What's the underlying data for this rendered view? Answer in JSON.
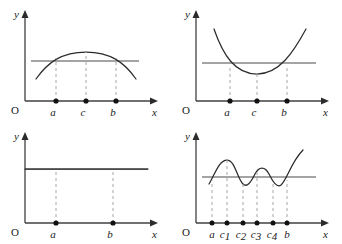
{
  "figure": {
    "background_color": "#ffffff",
    "axis_color": "#404040",
    "curve_color": "#2b2b2b",
    "dash_color": "#a8a8a8",
    "dot_color": "#111111",
    "width": 342,
    "height": 244
  },
  "panels": [
    {
      "id": "panel-top-left",
      "y_axis_label": "y",
      "x_axis_label": "x",
      "origin_label": "O",
      "curve_type": "downward-parabola",
      "curve_description": "concave-down parabola with maximum at c, intersecting the horizontal reference line at a and b",
      "reference_line": "horizontal",
      "ticks": [
        {
          "label": "a",
          "sub": "",
          "role": "left-intersection"
        },
        {
          "label": "c",
          "sub": "",
          "role": "maximum"
        },
        {
          "label": "b",
          "sub": "",
          "role": "right-intersection"
        }
      ]
    },
    {
      "id": "panel-top-right",
      "y_axis_label": "y",
      "x_axis_label": "x",
      "origin_label": "O",
      "curve_type": "upward-parabola",
      "curve_description": "concave-up parabola with minimum at c, intersecting the horizontal reference line at a and b",
      "reference_line": "horizontal",
      "ticks": [
        {
          "label": "a",
          "sub": "",
          "role": "left-intersection"
        },
        {
          "label": "c",
          "sub": "",
          "role": "minimum"
        },
        {
          "label": "b",
          "sub": "",
          "role": "right-intersection"
        }
      ]
    },
    {
      "id": "panel-bottom-left",
      "y_axis_label": "y",
      "x_axis_label": "x",
      "origin_label": "O",
      "curve_type": "constant",
      "curve_description": "constant function coinciding with the horizontal reference line across the whole interval",
      "reference_line": "horizontal",
      "ticks": [
        {
          "label": "a",
          "sub": "",
          "role": "interval-left"
        },
        {
          "label": "b",
          "sub": "",
          "role": "interval-right"
        }
      ]
    },
    {
      "id": "panel-bottom-right",
      "y_axis_label": "y",
      "x_axis_label": "x",
      "origin_label": "O",
      "curve_type": "oscillating",
      "curve_description": "wavy curve crossing the horizontal reference line at a and b with two maxima and two minima",
      "reference_line": "horizontal",
      "ticks": [
        {
          "label": "a",
          "sub": "",
          "role": "left-intersection"
        },
        {
          "label": "c",
          "sub": "1",
          "role": "maximum"
        },
        {
          "label": "c",
          "sub": "2",
          "role": "minimum"
        },
        {
          "label": "c",
          "sub": "3",
          "role": "maximum"
        },
        {
          "label": "c",
          "sub": "4",
          "role": "minimum"
        },
        {
          "label": "b",
          "sub": "",
          "role": "right-intersection"
        }
      ]
    }
  ]
}
